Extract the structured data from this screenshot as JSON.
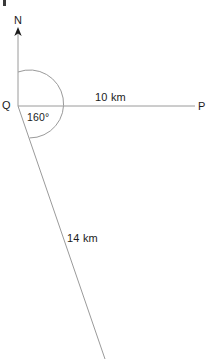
{
  "figure": {
    "type": "bearing-diagram",
    "width": 208,
    "height": 359,
    "background_color": "#ffffff",
    "line_color": "#9a9a9a",
    "arrow_color": "#1b1b1b",
    "text_color": "#1b1b1b"
  },
  "points": {
    "origin": {
      "label": "Q",
      "x": 18,
      "y": 106
    },
    "east": {
      "label": "P",
      "x": 195,
      "y": 106
    },
    "north": {
      "label": "N",
      "x": 18,
      "y": 28
    },
    "south_east_end": {
      "x": 105,
      "y": 359
    }
  },
  "labels": {
    "north": "N",
    "origin": "Q",
    "east": "P",
    "angle": "160°",
    "distance_horizontal": "10 km",
    "distance_slant": "14 km"
  },
  "measurements": {
    "bearing_degrees": 160,
    "bearing_text": "160°",
    "qp_distance": "10 km",
    "qp_value": 10,
    "qr_distance": "14 km",
    "qr_value": 14,
    "unit": "km"
  },
  "arc": {
    "center_x": 18,
    "center_y": 106,
    "radius": 34,
    "start_angle_deg": 0,
    "sweep_deg": 160
  },
  "geometry": {
    "north_ray": {
      "x1": 18,
      "y1": 30,
      "x2": 18,
      "y2": 106
    },
    "east_ray": {
      "x1": 18,
      "y1": 106,
      "x2": 195,
      "y2": 106
    },
    "slant_ray": {
      "x1": 18,
      "y1": 106,
      "x2": 105,
      "y2": 359
    },
    "arrow_head": {
      "x": 18,
      "y": 28,
      "direction": "up"
    }
  }
}
